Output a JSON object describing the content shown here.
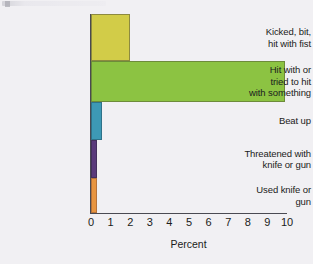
{
  "chart_data": {
    "type": "bar",
    "orientation": "horizontal",
    "title": "",
    "subtitle": "",
    "xlabel": "Percent",
    "ylabel": "",
    "xlim": [
      0,
      10
    ],
    "ylim": null,
    "grid": false,
    "legend": null,
    "xticks": [
      "0",
      "1",
      "2",
      "3",
      "4",
      "5",
      "6",
      "7",
      "8",
      "9",
      "10"
    ],
    "xtick_values": [
      0,
      1,
      2,
      3,
      4,
      5,
      6,
      7,
      8,
      9,
      10
    ],
    "categories": [
      "Kicked, bit,\nhit with fist",
      "Hit with or\ntried to hit\nwith something",
      "Beat up",
      "Threatened with\nknife or gun",
      "Used knife or\ngun"
    ],
    "values": [
      2.0,
      9.9,
      0.55,
      0.3,
      0.3
    ],
    "bars": [
      {
        "label_lines": [
          "Kicked, bit,",
          "hit with fist"
        ],
        "value": 2.0,
        "color": "#d2cc48"
      },
      {
        "label_lines": [
          "Hit with or",
          "tried to hit",
          "with something"
        ],
        "value": 9.9,
        "color": "#8cc342"
      },
      {
        "label_lines": [
          "Beat up"
        ],
        "value": 0.55,
        "color": "#3d99b5"
      },
      {
        "label_lines": [
          "Threatened with",
          " knife or gun"
        ],
        "value": 0.3,
        "color": "#5a3a7b"
      },
      {
        "label_lines": [
          "Used knife or",
          "gun"
        ],
        "value": 0.3,
        "color": "#e89540"
      }
    ],
    "colors": [
      "#d2cc48",
      "#8cc342",
      "#3d99b5",
      "#5a3a7b",
      "#e89540"
    ],
    "background_color": "#f1f0f3",
    "axis_color": "#4a4a52"
  }
}
